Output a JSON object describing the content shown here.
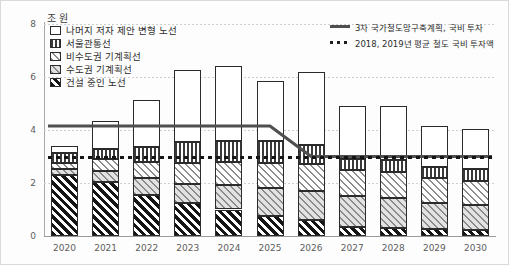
{
  "chart_data": {
    "type": "bar",
    "title": "",
    "unit_label": "조 원",
    "xlabel": "",
    "ylabel": "",
    "ylim": [
      0,
      8
    ],
    "yticks": [
      0,
      2,
      4,
      6,
      8
    ],
    "grid": true,
    "stacked": true,
    "legend_position": "top-left",
    "categories": [
      "2020",
      "2021",
      "2022",
      "2023",
      "2024",
      "2025",
      "2026",
      "2027",
      "2028",
      "2029",
      "2030"
    ],
    "series": [
      {
        "name": "건설 중인 노선",
        "pattern": "dark-diagonal-hatch",
        "values": [
          2.3,
          2.05,
          1.55,
          1.25,
          1.0,
          0.75,
          0.6,
          0.35,
          0.3,
          0.25,
          0.22
        ]
      },
      {
        "name": "수도권 기계획선",
        "pattern": "gray-diagonal-hatch",
        "values": [
          0.22,
          0.42,
          0.62,
          0.72,
          0.92,
          1.05,
          1.1,
          1.15,
          1.12,
          1.0,
          0.95
        ]
      },
      {
        "name": "비수도권 기계획선",
        "pattern": "light-diagonal-hatch",
        "values": [
          0.25,
          0.45,
          0.62,
          0.78,
          0.88,
          0.95,
          1.0,
          1.0,
          0.98,
          0.92,
          0.9
        ]
      },
      {
        "name": "서울관통선",
        "pattern": "vertical-stripes",
        "values": [
          0.38,
          0.38,
          0.58,
          0.78,
          0.78,
          0.82,
          0.72,
          0.42,
          0.45,
          0.42,
          0.45
        ]
      },
      {
        "name": "나머지 저자 제안 변형 노선",
        "pattern": "white-fill",
        "values": [
          0.25,
          1.05,
          1.78,
          2.72,
          2.82,
          2.28,
          2.78,
          1.98,
          2.05,
          1.56,
          1.53
        ]
      }
    ],
    "reference_lines": [
      {
        "name": "3차 국가철도망구축계획, 국비 투자",
        "style": "solid",
        "color": "#4f4f4f",
        "points": [
          {
            "x": "2020",
            "y": 4.15
          },
          {
            "x": "2021",
            "y": 4.15
          },
          {
            "x": "2022",
            "y": 4.15
          },
          {
            "x": "2023",
            "y": 4.15
          },
          {
            "x": "2024",
            "y": 4.15
          },
          {
            "x": "2025",
            "y": 4.15
          },
          {
            "x": "2026",
            "y": 3.0
          },
          {
            "x": "2027",
            "y": 3.0
          },
          {
            "x": "2028",
            "y": 3.0
          },
          {
            "x": "2029",
            "y": 3.0
          },
          {
            "x": "2030",
            "y": 3.0
          }
        ]
      },
      {
        "name": "2018, 2019년 평균 철도 국비 투자액",
        "style": "dotted",
        "color": "#141414",
        "value": 2.95
      }
    ]
  },
  "axis": {
    "unit": "조 원",
    "y_ticks": [
      "8",
      "6",
      "4",
      "2",
      "0"
    ],
    "x_ticks": [
      "2020",
      "2021",
      "2022",
      "2023",
      "2024",
      "2025",
      "2026",
      "2027",
      "2028",
      "2029",
      "2030"
    ]
  },
  "legend": {
    "swatch_items": [
      {
        "label": "나머지 저자 제안 변형 노선",
        "swatch": "white-fill"
      },
      {
        "label": "서울관통선",
        "swatch": "vertical-stripes"
      },
      {
        "label": "비수도권 기계획선",
        "swatch": "light-diagonal-hatch"
      },
      {
        "label": "수도권 기계획선",
        "swatch": "gray-diagonal-hatch"
      },
      {
        "label": "건설 중인 노선",
        "swatch": "dark-diagonal-hatch"
      }
    ],
    "line_items": [
      {
        "label": "3차 국가철도망구축계획, 국비 투자",
        "style": "solid"
      },
      {
        "label": "2018, 2019년 평균 철도 국비 투자액",
        "style": "dotted"
      }
    ]
  },
  "colors": {
    "plan_line": "#4f4f4f",
    "avg_line": "#141414",
    "bar_outline": "#2b2b2b",
    "grid": "#cfcfcf",
    "axis": "#9a9a9a",
    "text": "#2d2d2d"
  }
}
